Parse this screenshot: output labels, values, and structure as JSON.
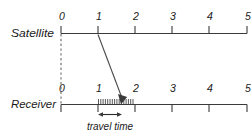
{
  "figure": {
    "colors": {
      "axis": "#3a3a3a",
      "dashed": "#6a6a6a",
      "signal": "#4a4a4a",
      "text": "#1a1a1a",
      "background": "#ffffff"
    },
    "axes": [
      {
        "id": "satellite",
        "label": "Satellite",
        "tick_labels": [
          "0",
          "1",
          "2",
          "3",
          "4",
          "5"
        ],
        "tick_values": [
          0,
          1,
          2,
          3,
          4,
          5
        ],
        "tick_direction": "up",
        "range": [
          0,
          5
        ]
      },
      {
        "id": "receiver",
        "label": "Receiver",
        "tick_labels": [
          "0",
          "1",
          "2",
          "3",
          "4",
          "5"
        ],
        "tick_values": [
          0,
          1,
          2,
          3,
          4,
          5
        ],
        "tick_direction": "down",
        "range": [
          0,
          5
        ]
      }
    ],
    "annotations": {
      "travel_time_label": "travel time",
      "travel_time_span": [
        1.0,
        1.67
      ],
      "signal_emit_time": 1.0,
      "signal_receive_time": 1.67,
      "sync_reference_time": 0,
      "hatch_count": 14
    }
  }
}
